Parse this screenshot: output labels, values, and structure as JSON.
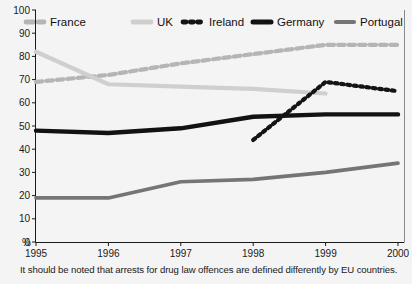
{
  "chart_data": {
    "type": "line",
    "title": "",
    "xlabel": "",
    "ylabel": "%",
    "categories": [
      "1995",
      "1996",
      "1997",
      "1998",
      "1999",
      "2000"
    ],
    "x": [
      1995,
      1996,
      1997,
      1998,
      1999,
      2000
    ],
    "xlim": [
      1995,
      2000
    ],
    "ylim": [
      0,
      100
    ],
    "ytick_labels": [
      "0",
      "10",
      "20",
      "30",
      "40",
      "50",
      "60",
      "70",
      "80",
      "90",
      "100"
    ],
    "yticks": [
      0,
      10,
      20,
      30,
      40,
      50,
      60,
      70,
      80,
      90,
      100
    ],
    "grid": false,
    "legend_position": "top",
    "series": [
      {
        "name": "France",
        "values": [
          69,
          72,
          77,
          81,
          85,
          85
        ],
        "color": "#b5b5b5",
        "style": "dashed",
        "width": 4.2,
        "legend_style": "dashed"
      },
      {
        "name": "UK",
        "values": [
          82,
          68,
          67,
          66,
          64,
          null
        ],
        "color": "#cfcfcf",
        "style": "solid",
        "width": 4.2,
        "legend_style": "solid"
      },
      {
        "name": "Ireland",
        "values": [
          null,
          null,
          null,
          44,
          69,
          65
        ],
        "color": "#141414",
        "style": "dotted",
        "width": 4.2,
        "legend_style": "dotted"
      },
      {
        "name": "Germany",
        "values": [
          48,
          47,
          49,
          54,
          55,
          55
        ],
        "color": "#121212",
        "style": "solid",
        "width": 4.4,
        "legend_style": "solid"
      },
      {
        "name": "Portugal",
        "values": [
          19,
          19,
          26,
          27,
          30,
          34
        ],
        "color": "#757575",
        "style": "solid",
        "width": 3.6,
        "legend_style": "solid"
      }
    ],
    "annotations": [
      "It should be noted that arrests for drug law offences are defined differently by EU countries."
    ]
  },
  "footnote": {
    "text": "It should be noted that arrests for drug law offences are defined differently by EU countries."
  },
  "colors": {
    "background": "#f4f4f4",
    "axis": "#1a1a1a",
    "text": "#1a1a1a"
  }
}
